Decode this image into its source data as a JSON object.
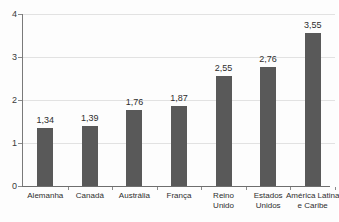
{
  "chart_data": {
    "type": "bar",
    "title": "",
    "subtitle": "",
    "xlabel": "",
    "ylabel": "",
    "ylim": [
      0,
      4
    ],
    "yticks": [
      "0",
      "1",
      "2",
      "3",
      "4"
    ],
    "grid": true,
    "legend": false,
    "legend_position": "none",
    "decimal_separator": ",",
    "bar_color": "#595959",
    "gridline_color": "#e2e2e2",
    "axis_color": "#7a7a7a",
    "categories": [
      "Alemanha",
      "Canadá",
      "Austrália",
      "França",
      "Reino Unido",
      "Estados Unidos",
      "América Latina e Caribe"
    ],
    "category_lines": [
      [
        "Alemanha"
      ],
      [
        "Canadá"
      ],
      [
        "Austrália"
      ],
      [
        "França"
      ],
      [
        "Reino",
        "Unido"
      ],
      [
        "Estados",
        "Unidos"
      ],
      [
        "América Latina",
        "e Caribe"
      ]
    ],
    "values": [
      1.34,
      1.39,
      1.76,
      1.87,
      2.55,
      2.76,
      3.55
    ],
    "value_labels": [
      "1,34",
      "1,39",
      "1,76",
      "1,87",
      "2,55",
      "2,76",
      "3,55"
    ]
  }
}
